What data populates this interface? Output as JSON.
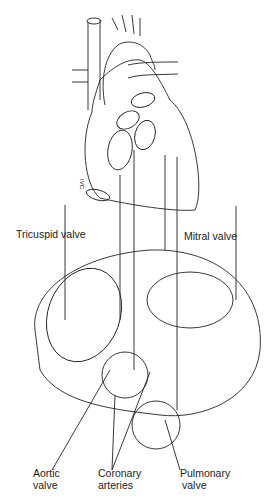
{
  "diagram": {
    "labels": {
      "tricuspid": "Tricuspid valve",
      "mitral": "Mitral valve",
      "aortic_line1": "Aortic",
      "aortic_line2": "valve",
      "coronary_line1": "Coronary",
      "coronary_line2": "arteries",
      "pulmonary_line1": "Pulmonary",
      "pulmonary_line2": "valve",
      "ivc": "IVC"
    },
    "colors": {
      "line": "#222222",
      "background": "#ffffff",
      "shade": "#cfcfcf"
    }
  }
}
